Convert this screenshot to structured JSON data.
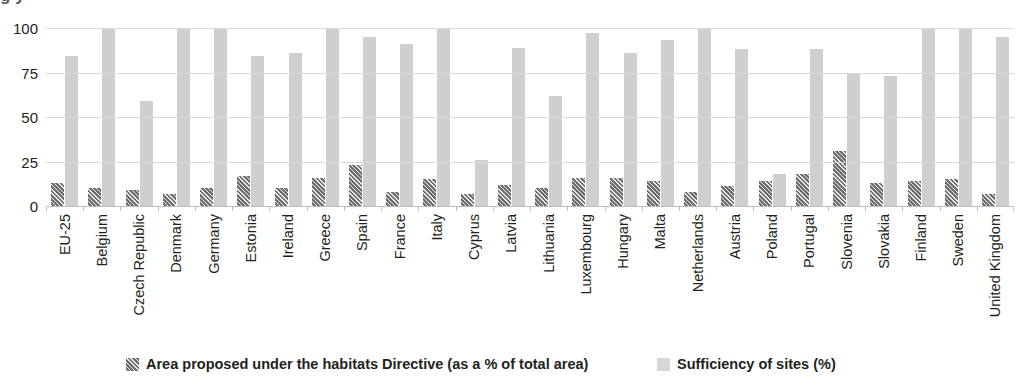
{
  "title_fragment": "g                                                                                                                                    y",
  "chart_data": {
    "type": "bar",
    "title": "",
    "xlabel": "",
    "ylabel": "",
    "ylim": [
      0,
      100
    ],
    "yticks": [
      0,
      25,
      50,
      75,
      100
    ],
    "grid": true,
    "legend_position": "bottom",
    "categories": [
      "EU-25",
      "Belgium",
      "Czech Republic",
      "Denmark",
      "Germany",
      "Estonia",
      "Ireland",
      "Greece",
      "Spain",
      "France",
      "Italy",
      "Cyprus",
      "Latvia",
      "Lithuania",
      "Luxembourg",
      "Hungary",
      "Malta",
      "Netherlands",
      "Austria",
      "Poland",
      "Portugal",
      "Slovenia",
      "Slovakia",
      "Finland",
      "Sweden",
      "United Kingdom"
    ],
    "series": [
      {
        "name": "Area proposed under the habitats Directive (as a % of total area)",
        "style": "hatched",
        "color": "#6d6e70",
        "values": [
          13,
          10,
          9,
          7,
          10,
          17,
          10,
          16,
          23,
          8,
          15,
          7,
          12,
          10,
          16,
          16,
          14,
          8,
          11,
          14,
          18,
          31,
          13,
          14,
          15,
          7
        ]
      },
      {
        "name": "Sufficiency of sites (%)",
        "style": "solid",
        "color": "#cfcfcf",
        "values": [
          84,
          100,
          59,
          100,
          100,
          84,
          86,
          100,
          95,
          91,
          100,
          26,
          89,
          62,
          97,
          86,
          93,
          100,
          88,
          18,
          88,
          74,
          73,
          100,
          100,
          95
        ]
      }
    ]
  },
  "legend": [
    {
      "label": "Area proposed under the habitats Directive (as a % of total area)",
      "swatch": "hatched"
    },
    {
      "label": "Sufficiency of sites (%)",
      "swatch": "solid"
    }
  ]
}
